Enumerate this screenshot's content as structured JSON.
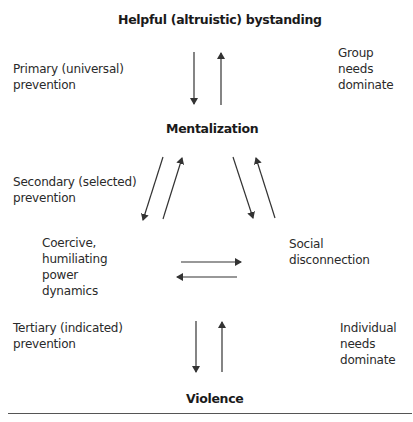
{
  "nodes": {
    "top": "Helpful (altruistic) bystanding",
    "middle": "Mentalization",
    "left": "Coercive,\nhumiliating\npower\ndynamics",
    "right": "Social\ndisconnection",
    "bottom": "Violence"
  },
  "labels": {
    "primary": "Primary (universal)\nprevention",
    "secondary": "Secondary (selected)\nprevention",
    "tertiary": "Tertiary (indicated)\nprevention",
    "group": "Group\nneeds\ndominate",
    "individual": "Individual\nneeds\ndominate"
  },
  "colors": {
    "text": "#2a2a2a",
    "arrow": "#333333",
    "rule": "#555555"
  }
}
